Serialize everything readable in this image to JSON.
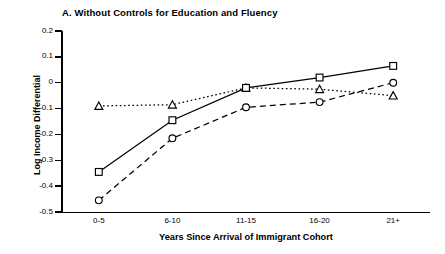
{
  "panel": {
    "label": "A.",
    "title": "A.  Without Controls for Education and Fluency"
  },
  "axes": {
    "ylabel": "Log Income Differential",
    "xlabel": "Years Since Arrival of Immigrant Cohort",
    "yticks": [
      "0.2",
      "0.1",
      "0",
      "-0.1",
      "-0.2",
      "-0.3",
      "-0.4",
      "-0.5"
    ],
    "xticks": [
      "0-5",
      "6-10",
      "11-15",
      "16-20",
      "21+"
    ]
  },
  "colors": {
    "ink": "#000000",
    "background": "#ffffff"
  },
  "chart_data": {
    "type": "line",
    "title": "A.  Without Controls for Education and Fluency",
    "xlabel": "Years Since Arrival of Immigrant Cohort",
    "ylabel": "Log Income Differential",
    "categories": [
      "0-5",
      "6-10",
      "11-15",
      "16-20",
      "21+"
    ],
    "ylim": [
      -0.5,
      0.2
    ],
    "ytick_values": [
      0.2,
      0.1,
      0.0,
      -0.1,
      -0.2,
      -0.3,
      -0.4,
      -0.5
    ],
    "grid": false,
    "legend": "none",
    "series": [
      {
        "name": "series-triangle",
        "marker": "triangle",
        "linestyle": "dotted",
        "values": [
          -0.09,
          -0.085,
          -0.02,
          -0.025,
          -0.05
        ]
      },
      {
        "name": "series-square",
        "marker": "square",
        "linestyle": "solid",
        "values": [
          -0.345,
          -0.145,
          -0.02,
          0.02,
          0.065
        ]
      },
      {
        "name": "series-circle",
        "marker": "circle",
        "linestyle": "dashed",
        "values": [
          -0.455,
          -0.215,
          -0.095,
          -0.075,
          0.0
        ]
      }
    ]
  }
}
